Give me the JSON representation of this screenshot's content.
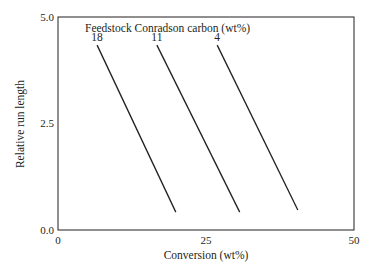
{
  "chart_data": {
    "type": "line",
    "title": "",
    "annotation": "Feedstock Conradson carbon (wt%)",
    "xlabel": "Conversion (wt%)",
    "ylabel": "Relative run length",
    "xlim": [
      0,
      50
    ],
    "ylim": [
      0.0,
      5.0
    ],
    "xticks": [
      "0",
      "25",
      "50"
    ],
    "yticks": [
      "0.0",
      "2.5",
      "5.0"
    ],
    "grid": false,
    "legend_position": "none (inline labels at top of lines)",
    "series": [
      {
        "name": "18",
        "x": [
          6.6,
          19.9
        ],
        "y": [
          4.34,
          0.42
        ]
      },
      {
        "name": "11",
        "x": [
          16.7,
          30.7
        ],
        "y": [
          4.34,
          0.42
        ]
      },
      {
        "name": "4",
        "x": [
          26.9,
          40.5
        ],
        "y": [
          4.34,
          0.47
        ]
      }
    ]
  },
  "colors": {
    "line": "#231f20",
    "axis": "#231f20",
    "background": "#ffffff"
  }
}
